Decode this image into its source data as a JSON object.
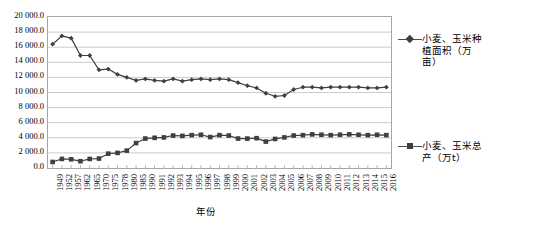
{
  "chart_data": {
    "type": "line",
    "title": "",
    "xlabel": "年份",
    "ylabel": "",
    "ylim": [
      0,
      20000
    ],
    "ytick_step": 2000,
    "grid": true,
    "legend_position": "right",
    "y_tick_labels": [
      "20 000.0",
      "18 000.0",
      "16 000.0",
      "14 000.0",
      "12 000.0",
      "10 000.0",
      "8 000.0",
      "6 000.0",
      "4 000.0",
      "2 000.0",
      "0.0"
    ],
    "y_tick_values": [
      20000,
      18000,
      16000,
      14000,
      12000,
      10000,
      8000,
      6000,
      4000,
      2000,
      0
    ],
    "categories": [
      "1949",
      "1952",
      "1957",
      "1962",
      "1965",
      "1970",
      "1975",
      "1978",
      "1980",
      "1985",
      "1990",
      "1991",
      "1992",
      "1993",
      "1994",
      "1995",
      "1996",
      "1997",
      "1998",
      "1999",
      "2000",
      "2001",
      "2002",
      "2003",
      "2004",
      "2005",
      "2006",
      "2007",
      "2008",
      "2009",
      "2010",
      "2011",
      "2012",
      "2013",
      "2014",
      "2015",
      "2016"
    ],
    "series": [
      {
        "name": "小麦、玉米种植面积（万亩）",
        "unit": "万亩",
        "marker": "diamond",
        "color": "#3f3f3f",
        "values": [
          16400,
          17500,
          17200,
          14900,
          14900,
          13000,
          13100,
          12400,
          12000,
          11600,
          11800,
          11600,
          11500,
          11800,
          11500,
          11700,
          11800,
          11700,
          11800,
          11700,
          11300,
          10900,
          10600,
          9900,
          9500,
          9600,
          10400,
          10700,
          10700,
          10600,
          10700,
          10700,
          10700,
          10700,
          10600,
          10600,
          10700
        ]
      },
      {
        "name": "小麦、玉米总产（万t）",
        "unit": "万t",
        "marker": "square",
        "color": "#3f3f3f",
        "values": [
          800,
          1200,
          1150,
          900,
          1200,
          1250,
          1900,
          2000,
          2300,
          3300,
          3900,
          4000,
          4050,
          4300,
          4250,
          4350,
          4400,
          4100,
          4350,
          4300,
          3900,
          3900,
          3950,
          3500,
          3850,
          4050,
          4300,
          4350,
          4450,
          4400,
          4350,
          4400,
          4450,
          4400,
          4350,
          4400,
          4350
        ]
      }
    ]
  },
  "legend": {
    "entries": [
      {
        "label": "小麦、玉米种植面积（万亩）",
        "marker": "diamond-marker"
      },
      {
        "label": "小麦、玉米总产（万t）",
        "marker": "square-marker"
      }
    ]
  },
  "axis": {
    "x_title": "年份"
  },
  "colors": {
    "line": "#4d4d4d",
    "marker": "#3f3f3f",
    "grid": "#bfbfbf",
    "border": "#a6a6a6",
    "background": "#ffffff"
  }
}
